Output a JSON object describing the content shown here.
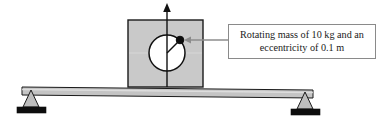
{
  "figure": {
    "colors": {
      "block_fill": "#c9c9c9",
      "beam_fill": "#c4c4c4",
      "support_fill": "#bdbdbd",
      "base_plate_fill": "#0d0d0d",
      "outline": "#1a1a1a",
      "leader_line": "#8c8c8c",
      "callout_border": "#8a8a8a",
      "background": "#ffffff"
    },
    "callout": {
      "line1": "Rotating mass of 10 kg and an",
      "line2": "eccentricity of 0.1 m"
    },
    "labels": {
      "block": "machine-block",
      "circle": "rotor-circle",
      "mass_dot": "eccentric-mass",
      "radius": "eccentricity-radius",
      "arrow": "excitation-force-arrow",
      "beam": "beam",
      "left_support": "left-pin-support",
      "right_support": "right-pin-support"
    },
    "geometry": {
      "block": {
        "x": 128,
        "y": 20,
        "width": 75,
        "height": 67
      },
      "circle": {
        "cx": 167,
        "cy": 53,
        "r": 18
      },
      "mass_dot": {
        "cx": 180,
        "cy": 40,
        "r": 3.6
      },
      "arrow": {
        "x": 167,
        "y_top": 4,
        "y_bottom": 87
      },
      "beam": {
        "x1": 22,
        "y1": 87,
        "x2": 313,
        "y2": 90,
        "thickness": 8
      },
      "left_support": {
        "cx": 31,
        "top_y": 91,
        "base_y": 108
      },
      "right_support": {
        "cx": 305,
        "top_y": 93,
        "base_y": 110
      },
      "leader": {
        "x_start": 228,
        "x_end": 186,
        "y": 40
      }
    }
  }
}
